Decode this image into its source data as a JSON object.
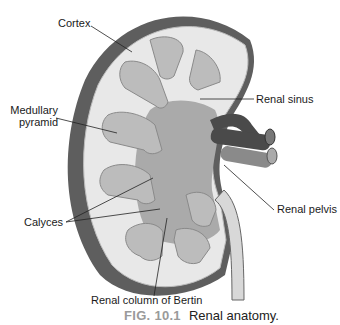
{
  "labels": {
    "cortex": "Cortex",
    "medullary_pyramid_1": "Medullary",
    "medullary_pyramid_2": "pyramid",
    "renal_sinus": "Renal sinus",
    "renal_pelvis": "Renal pelvis",
    "calyces": "Calyces",
    "renal_column": "Renal column of Bertin"
  },
  "caption": {
    "figure_number": "FIG. 10.1",
    "title": "Renal anatomy."
  },
  "colors": {
    "capsule": "#5a5a5a",
    "cortex": "#e6e6e6",
    "pyramid": "#b8b8b8",
    "sinus": "#a8a8a8",
    "vessel": "#4a4a4a"
  }
}
